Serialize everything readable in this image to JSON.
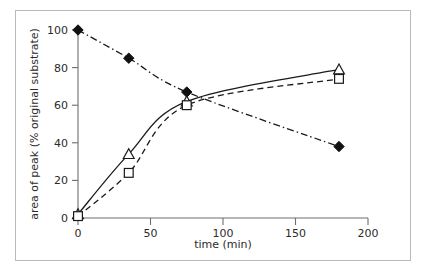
{
  "chart_data": {
    "type": "line",
    "title": "",
    "subtitle": "",
    "xlabel": "time (min)",
    "ylabel": "area of peak (% original substrate)",
    "xlim": [
      0,
      200
    ],
    "ylim": [
      0,
      100
    ],
    "xticks": [
      0,
      50,
      100,
      150,
      200
    ],
    "yticks": [
      0,
      20,
      40,
      60,
      80,
      100
    ],
    "xtick_labels": [
      "0",
      "50",
      "100",
      "150",
      "200"
    ],
    "ytick_labels": [
      "0",
      "20",
      "40",
      "60",
      "80",
      "100"
    ],
    "grid": false,
    "legend": "none",
    "series": [
      {
        "name": "substrate",
        "marker": "filled-diamond",
        "line_style": "dash-dot",
        "x": [
          0,
          35,
          75,
          180
        ],
        "values": [
          100,
          85,
          67,
          38
        ]
      },
      {
        "name": "product-triangle",
        "marker": "open-triangle",
        "line_style": "solid",
        "x": [
          0,
          35,
          75,
          180
        ],
        "values": [
          2,
          34,
          62,
          79
        ]
      },
      {
        "name": "product-square",
        "marker": "open-square",
        "line_style": "dashed",
        "x": [
          0,
          35,
          75,
          180
        ],
        "values": [
          1,
          24,
          60,
          74
        ]
      }
    ]
  },
  "axes": {
    "x_axis_name": "time-axis",
    "y_axis_name": "area-axis",
    "x_title": "time (min)",
    "y_title": "area of peak (% original substrate)"
  },
  "ticks": {
    "x": [
      "0",
      "50",
      "100",
      "150",
      "200"
    ],
    "y": [
      "0",
      "20",
      "40",
      "60",
      "80",
      "100"
    ]
  },
  "colors": {
    "axis": "#6f6f6f",
    "series": "#1a1a1a",
    "frame": "#b9b9b9",
    "background": "#ffffff",
    "marker_fill": "#ffffff"
  }
}
